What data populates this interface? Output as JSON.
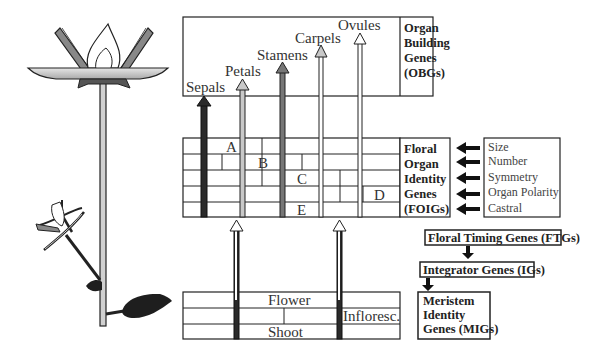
{
  "organ_labels": [
    "Sepals",
    "Petals",
    "Stamens",
    "Carpels",
    "Ovules"
  ],
  "obg_box": [
    "Organ",
    "Building",
    "Genes",
    "(OBGs)"
  ],
  "foig_box": [
    "Floral",
    "Organ",
    "Identity",
    "Genes",
    "(FOIGs)"
  ],
  "abc_labels": {
    "a": "A",
    "b": "B",
    "c": "C",
    "d": "D",
    "e": "E"
  },
  "traits": [
    "Size",
    "Number",
    "Symmetry",
    "Organ Polarity",
    "Castral"
  ],
  "ftg_label": "Floral Timing Genes (FTGs)",
  "ig_label": "Integrator Genes (IGs)",
  "mig_box": [
    "Meristem",
    "Identity",
    "Genes (MIGs)"
  ],
  "meristem_labels": {
    "flower": "Flower",
    "infloresc": "Infloresc.",
    "shoot": "Shoot"
  },
  "colors": {
    "dark": "#2a2a2a",
    "mid": "#777777",
    "light": "#c8c8c8",
    "leaf": "#1e1e1e"
  }
}
